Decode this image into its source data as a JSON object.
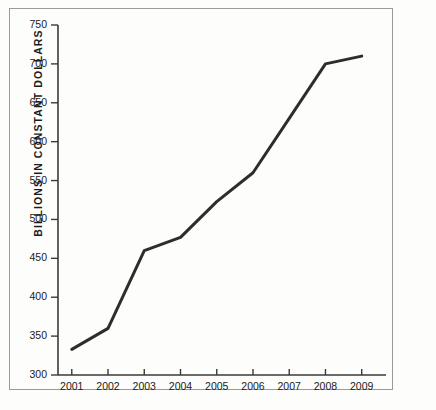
{
  "chart_data": {
    "type": "line",
    "title": "",
    "subtitle": "",
    "xlabel": "",
    "ylabel": "BILLIONS IN CONSTANT DOLLARS",
    "categories": [
      "2001",
      "2002",
      "2003",
      "2004",
      "2005",
      "2006",
      "2007",
      "2008",
      "2009"
    ],
    "x": [
      2001,
      2002,
      2003,
      2004,
      2005,
      2006,
      2007,
      2008,
      2009
    ],
    "values": [
      333,
      360,
      460,
      477,
      523,
      560,
      630,
      700,
      710
    ],
    "series": [
      {
        "name": "Billions in constant dollars",
        "values": [
          333,
          360,
          460,
          477,
          523,
          560,
          630,
          700,
          710
        ]
      }
    ],
    "ylim": [
      300,
      750
    ],
    "yticks": [
      300,
      350,
      400,
      450,
      500,
      550,
      600,
      650,
      700,
      750
    ],
    "ytick_labels": [
      "300",
      "350",
      "400",
      "450",
      "500",
      "550",
      "600",
      "650",
      "700",
      "750"
    ],
    "xticks": [
      2001,
      2002,
      2003,
      2004,
      2005,
      2006,
      2007,
      2008,
      2009
    ],
    "xtick_labels": [
      "2001",
      "2002",
      "2003",
      "2004",
      "2005",
      "2006",
      "2007",
      "2008",
      "2009"
    ],
    "grid": false,
    "legend": false,
    "legend_position": "none",
    "line_color": "#2e2d2b",
    "line_width": 3,
    "axis_color": "#3a3a3a",
    "border_color": "#9a9a9a",
    "background_color": "#fdfdfc",
    "text_color": "#1b1b1b",
    "markers": false,
    "annotations": []
  }
}
